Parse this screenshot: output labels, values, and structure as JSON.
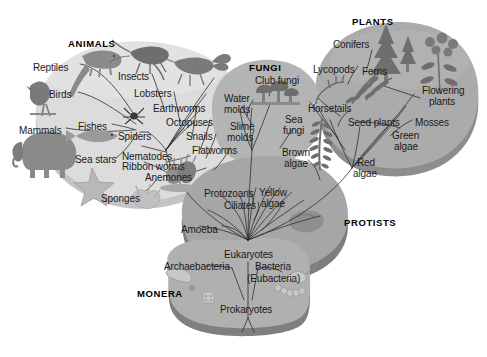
{
  "diagram": {
    "type": "phylogenetic-tree",
    "style": "grayscale textbook illustration",
    "colors": {
      "background": "#ffffff",
      "animals_blob": "#dcdcdc",
      "animals_edge": "#c2c2c2",
      "fungi_blob": "#b4b4b4",
      "plants_blob": "#ababab",
      "plants_edge": "#8a8a8a",
      "protists_blob": "#a6a6a6",
      "protists_edge": "#7e7e7e",
      "monera_blob": "#b0b0b0",
      "monera_edge": "#828282",
      "text": "#1a1a1a",
      "branch_line": "#333333",
      "organism_art": "#6e6e6e"
    }
  },
  "kingdoms": [
    {
      "id": "animals",
      "label": "ANIMALS",
      "x": 68,
      "y": 38
    },
    {
      "id": "fungi",
      "label": "FUNGI",
      "x": 249,
      "y": 62
    },
    {
      "id": "plants",
      "label": "PLANTS",
      "x": 352,
      "y": 16
    },
    {
      "id": "protists",
      "label": "PROTISTS",
      "x": 344,
      "y": 217
    },
    {
      "id": "monera",
      "label": "MONERA",
      "x": 137,
      "y": 288
    }
  ],
  "labels": {
    "animals": [
      {
        "text": "Reptiles",
        "x": 33,
        "y": 63,
        "align": "left"
      },
      {
        "text": "Birds",
        "x": 49,
        "y": 90,
        "align": "left"
      },
      {
        "text": "Mammals",
        "x": 19,
        "y": 126,
        "align": "left"
      },
      {
        "text": "Fishes",
        "x": 78,
        "y": 122,
        "align": "left"
      },
      {
        "text": "Sea stars",
        "x": 75,
        "y": 155,
        "align": "left"
      },
      {
        "text": "Sponges",
        "x": 101,
        "y": 194,
        "align": "left"
      },
      {
        "text": "Spiders",
        "x": 118,
        "y": 132,
        "align": "left"
      },
      {
        "text": "Insects",
        "x": 118,
        "y": 72,
        "align": "left"
      },
      {
        "text": "Lobsters",
        "x": 134,
        "y": 89,
        "align": "left"
      },
      {
        "text": "Earthworms",
        "x": 153,
        "y": 104,
        "align": "left"
      },
      {
        "text": "Octopuses",
        "x": 166,
        "y": 118,
        "align": "left"
      },
      {
        "text": "Snails",
        "x": 186,
        "y": 132,
        "align": "left"
      },
      {
        "text": "Flatworms",
        "x": 192,
        "y": 146,
        "align": "left"
      },
      {
        "text": "Nematodes",
        "x": 122,
        "y": 152,
        "align": "left"
      },
      {
        "text": "Ribbon worms",
        "x": 122,
        "y": 162,
        "align": "left"
      },
      {
        "text": "Anemones",
        "x": 145,
        "y": 173,
        "align": "left"
      }
    ],
    "fungi": [
      {
        "text": "Club fungi",
        "x": 255,
        "y": 76,
        "align": "left"
      },
      {
        "text": "Water",
        "x": 224,
        "y": 94,
        "align": "left"
      },
      {
        "text": "molds",
        "x": 224,
        "y": 105,
        "align": "left"
      },
      {
        "text": "Slime",
        "x": 230,
        "y": 122,
        "align": "left"
      },
      {
        "text": "molds",
        "x": 227,
        "y": 133,
        "align": "left"
      },
      {
        "text": "Sea",
        "x": 285,
        "y": 115,
        "align": "left"
      },
      {
        "text": "fungi",
        "x": 283,
        "y": 126,
        "align": "left"
      }
    ],
    "protists": [
      {
        "text": "Brown",
        "x": 282,
        "y": 148,
        "align": "left"
      },
      {
        "text": "algae",
        "x": 284,
        "y": 159,
        "align": "left"
      },
      {
        "text": "Protozoans",
        "x": 204,
        "y": 189,
        "align": "left"
      },
      {
        "text": "Ciliates",
        "x": 224,
        "y": 201,
        "align": "left"
      },
      {
        "text": "Yellow",
        "x": 259,
        "y": 188,
        "align": "left"
      },
      {
        "text": "algae",
        "x": 261,
        "y": 199,
        "align": "left"
      },
      {
        "text": "Amoeba",
        "x": 181,
        "y": 225,
        "align": "left"
      },
      {
        "text": "Red",
        "x": 357,
        "y": 158,
        "align": "left"
      },
      {
        "text": "algae",
        "x": 353,
        "y": 169,
        "align": "left"
      }
    ],
    "plants": [
      {
        "text": "Conifers",
        "x": 333,
        "y": 40,
        "align": "left"
      },
      {
        "text": "Lycopods",
        "x": 313,
        "y": 65,
        "align": "left"
      },
      {
        "text": "Ferns",
        "x": 362,
        "y": 67,
        "align": "left"
      },
      {
        "text": "Flowering",
        "x": 422,
        "y": 86,
        "align": "left"
      },
      {
        "text": "plants",
        "x": 429,
        "y": 97,
        "align": "left"
      },
      {
        "text": "Horsetails",
        "x": 308,
        "y": 104,
        "align": "left"
      },
      {
        "text": "Seed plants",
        "x": 348,
        "y": 118,
        "align": "left"
      },
      {
        "text": "Mosses",
        "x": 415,
        "y": 118,
        "align": "left"
      },
      {
        "text": "Green",
        "x": 392,
        "y": 131,
        "align": "left"
      },
      {
        "text": "algae",
        "x": 394,
        "y": 142,
        "align": "left"
      }
    ],
    "monera": [
      {
        "text": "Eukaryotes",
        "x": 224,
        "y": 250,
        "align": "left"
      },
      {
        "text": "Archaebacteria",
        "x": 164,
        "y": 262,
        "align": "left"
      },
      {
        "text": "Bacteria",
        "x": 255,
        "y": 262,
        "align": "left"
      },
      {
        "text": "(Eubacteria)",
        "x": 247,
        "y": 274,
        "align": "left"
      },
      {
        "text": "Prokaryotes",
        "x": 220,
        "y": 305,
        "align": "left"
      }
    ]
  },
  "organisms": [
    {
      "name": "reptile-lizard",
      "group": "animals"
    },
    {
      "name": "bird",
      "group": "animals"
    },
    {
      "name": "elephant-mammal",
      "group": "animals"
    },
    {
      "name": "fish",
      "group": "animals"
    },
    {
      "name": "sea-star",
      "group": "animals"
    },
    {
      "name": "sponge",
      "group": "animals"
    },
    {
      "name": "spider",
      "group": "animals"
    },
    {
      "name": "insect-cricket",
      "group": "animals"
    },
    {
      "name": "lobster",
      "group": "animals"
    },
    {
      "name": "anemone",
      "group": "animals"
    },
    {
      "name": "club-fungi-mushrooms",
      "group": "fungi"
    },
    {
      "name": "brown-algae-kelp",
      "group": "protists"
    },
    {
      "name": "amoeba",
      "group": "protists"
    },
    {
      "name": "conifer-tree-large",
      "group": "plants"
    },
    {
      "name": "conifer-tree-small",
      "group": "plants"
    },
    {
      "name": "fern",
      "group": "plants"
    },
    {
      "name": "flowering-plant",
      "group": "plants"
    },
    {
      "name": "lycopod",
      "group": "plants"
    },
    {
      "name": "bacterium-rod",
      "group": "monera"
    },
    {
      "name": "bacterium-chain",
      "group": "monera"
    },
    {
      "name": "bacterium-flagellate",
      "group": "monera"
    }
  ]
}
